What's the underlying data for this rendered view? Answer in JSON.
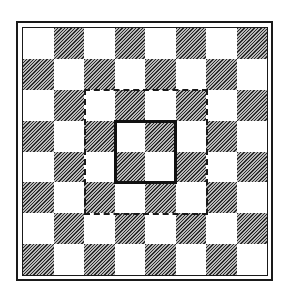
{
  "diagram": {
    "type": "chessboard",
    "rows": 8,
    "cols": 8,
    "top_left_square": "light",
    "colors": {
      "light": "#ffffff",
      "dark": "hatched",
      "border": "#1a1a1a"
    },
    "frame": "double-line",
    "highlights": [
      {
        "name": "dashed-region",
        "style": "dashed",
        "row_start": 2,
        "col_start": 2,
        "size": 4
      },
      {
        "name": "solid-region",
        "style": "solid",
        "row_start": 3,
        "col_start": 3,
        "size": 2
      }
    ]
  }
}
